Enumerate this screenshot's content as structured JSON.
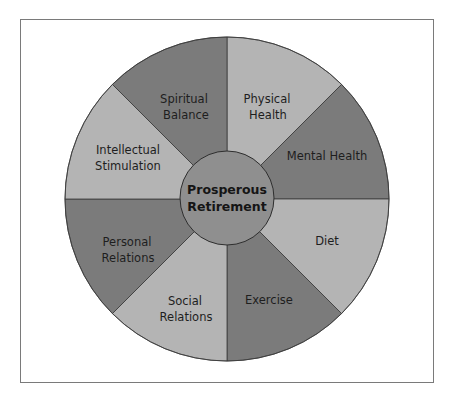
{
  "diagram": {
    "center": {
      "line1": "Prosperous",
      "line2": "Retirement",
      "fill": "#8f8f8f"
    },
    "colors": {
      "dark": "#7b7b7b",
      "light": "#b4b4b4",
      "stroke": "#3a3a3a",
      "frame": "#7a7a7a"
    },
    "segments": [
      {
        "id": "physical-health",
        "line1": "Physical",
        "line2": "Health",
        "shade": "light"
      },
      {
        "id": "mental-health",
        "line1": "Mental Health",
        "line2": "",
        "shade": "dark"
      },
      {
        "id": "diet",
        "line1": "Diet",
        "line2": "",
        "shade": "light"
      },
      {
        "id": "exercise",
        "line1": "Exercise",
        "line2": "",
        "shade": "dark"
      },
      {
        "id": "social-relations",
        "line1": "Social",
        "line2": "Relations",
        "shade": "light"
      },
      {
        "id": "personal-relations",
        "line1": "Personal",
        "line2": "Relations",
        "shade": "dark"
      },
      {
        "id": "intellectual-stimulation",
        "line1": "Intellectual",
        "line2": "Stimulation",
        "shade": "light"
      },
      {
        "id": "spiritual-balance",
        "line1": "Spiritual",
        "line2": "Balance",
        "shade": "dark"
      }
    ]
  }
}
